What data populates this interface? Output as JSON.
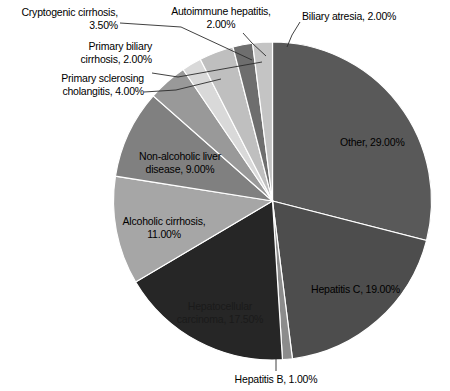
{
  "chart_data": {
    "type": "pie",
    "title": "",
    "legend_position": "none",
    "labels_show_percent": true,
    "start_angle_deg": 0,
    "direction": "clockwise",
    "categories": [
      "Other",
      "Hepatitis C",
      "Hepatitis B",
      "Hepatocellular carcinoma",
      "Alcoholic cirrhosis",
      "Non-alcoholic liver disease",
      "Primary sclerosing cholangitis",
      "Primary biliary cirrhosis",
      "Cryptogenic cirrhosis",
      "Autoimmune hepatitis",
      "Biliary atresia"
    ],
    "values": [
      29.0,
      19.0,
      1.0,
      17.5,
      11.0,
      9.0,
      4.0,
      2.0,
      3.5,
      2.0,
      2.0
    ],
    "units": "%",
    "total": 100.0,
    "colors": [
      "#595959",
      "#4d4d4d",
      "#8c8c8c",
      "#262626",
      "#a6a6a6",
      "#808080",
      "#999999",
      "#d9d9d9",
      "#bfbfbf",
      "#6e6e6e",
      "#c4c4c4"
    ],
    "slices": [
      {
        "label": "Other, 29.00%",
        "name": "Other",
        "value": 29.0,
        "color": "#595959"
      },
      {
        "label": "Hepatitis C, 19.00%",
        "name": "Hepatitis C",
        "value": 19.0,
        "color": "#4d4d4d"
      },
      {
        "label": "Hepatitis B, 1.00%",
        "name": "Hepatitis B",
        "value": 1.0,
        "color": "#8c8c8c"
      },
      {
        "label": "Hepatocellular carcinoma, 17.50%",
        "name": "Hepatocellular carcinoma",
        "value": 17.5,
        "color": "#262626"
      },
      {
        "label": "Alcoholic cirrhosis, 11.00%",
        "name": "Alcoholic cirrhosis",
        "value": 11.0,
        "color": "#a6a6a6"
      },
      {
        "label": "Non-alcoholic liver disease, 9.00%",
        "name": "Non-alcoholic liver disease",
        "value": 9.0,
        "color": "#808080"
      },
      {
        "label": "Primary sclerosing cholangitis, 4.00%",
        "name": "Primary sclerosing cholangitis",
        "value": 4.0,
        "color": "#999999"
      },
      {
        "label": "Primary biliary cirrhosis, 2.00%",
        "name": "Primary biliary cirrhosis",
        "value": 2.0,
        "color": "#d9d9d9"
      },
      {
        "label": "Cryptogenic cirrhosis, 3.50%",
        "name": "Cryptogenic cirrhosis",
        "value": 3.5,
        "color": "#bfbfbf"
      },
      {
        "label": "Autoimmune hepatitis, 2.00%",
        "name": "Autoimmune hepatitis",
        "value": 2.0,
        "color": "#6e6e6e"
      },
      {
        "label": "Biliary atresia, 2.00%",
        "name": "Biliary atresia",
        "value": 2.0,
        "color": "#c4c4c4"
      }
    ]
  },
  "labels": {
    "other": "Other, 29.00%",
    "hepatitis_c": "Hepatitis C, 19.00%",
    "hepatitis_b": "Hepatitis B, 1.00%",
    "hepatocellular_carcinoma": "Hepatocellular\ncarcinoma, 17.50%",
    "alcoholic_cirrhosis": "Alcoholic cirrhosis,\n11.00%",
    "non_alcoholic_liver_disease": "Non-alcoholic liver\ndisease, 9.00%",
    "primary_sclerosing_cholangitis": "Primary sclerosing\ncholangitis, 4.00%",
    "primary_biliary_cirrhosis": "Primary biliary\ncirrhosis, 2.00%",
    "cryptogenic_cirrhosis": "Cryptogenic cirrhosis,\n3.50%",
    "autoimmune_hepatitis": "Autoimmune hepatitis,\n2.00%",
    "biliary_atresia": "Biliary atresia, 2.00%"
  }
}
